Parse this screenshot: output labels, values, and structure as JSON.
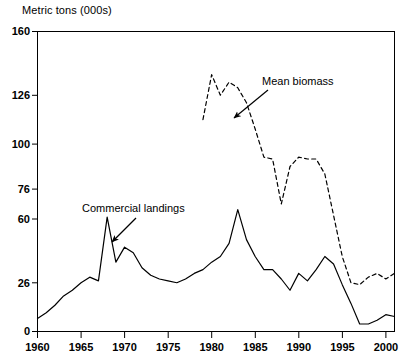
{
  "chart_data": {
    "type": "line",
    "title": "Metric tons (000s)",
    "xlabel": "",
    "ylabel": "Metric tons (000s)",
    "xlim": [
      1960,
      2001
    ],
    "ylim": [
      0,
      160
    ],
    "grid": false,
    "legend_position": "inline-annotations",
    "ytick_labels": [
      "160",
      "126",
      "100",
      "76",
      "60",
      "26",
      "0"
    ],
    "ytick_values": [
      160,
      126,
      100,
      76,
      60,
      26,
      0
    ],
    "xtick_labels": [
      "1960",
      "1965",
      "1970",
      "1975",
      "1980",
      "1985",
      "1990",
      "1995",
      "2000"
    ],
    "xtick_values": [
      1960,
      1965,
      1970,
      1975,
      1980,
      1985,
      1990,
      1995,
      2000
    ],
    "annotations": [
      {
        "name": "mean-biomass-annotation",
        "text": "Mean biomass",
        "text_x": 262,
        "text_y": 75,
        "arrow_from_x": 268,
        "arrow_from_y": 90,
        "arrow_to_x": 234,
        "arrow_to_y": 118
      },
      {
        "name": "commercial-landings-annotation",
        "text": "Commercial landings",
        "text_x": 82,
        "text_y": 202,
        "arrow_from_x": 136,
        "arrow_from_y": 218,
        "arrow_to_x": 112,
        "arrow_to_y": 242
      }
    ],
    "series": [
      {
        "name": "Commercial landings",
        "style": "solid",
        "color": "#000000",
        "x": [
          1960,
          1961,
          1962,
          1963,
          1964,
          1965,
          1966,
          1967,
          1968,
          1969,
          1970,
          1971,
          1972,
          1973,
          1974,
          1975,
          1976,
          1977,
          1978,
          1979,
          1980,
          1981,
          1982,
          1983,
          1984,
          1985,
          1986,
          1987,
          1988,
          1989,
          1990,
          1991,
          1992,
          1993,
          1994,
          1995,
          1996,
          1997,
          1998,
          1999,
          2000,
          2001
        ],
        "values": [
          7,
          10,
          14,
          19,
          22,
          26,
          29,
          27,
          61,
          37,
          45,
          42,
          34,
          30,
          28,
          27,
          26,
          28,
          31,
          33,
          37,
          40,
          47,
          65,
          49,
          40,
          33,
          33,
          28,
          22,
          31,
          27,
          33,
          40,
          36,
          25,
          15,
          4,
          4,
          6,
          9,
          8
        ]
      },
      {
        "name": "Mean biomass",
        "style": "dashed",
        "color": "#000000",
        "x": [
          1979,
          1980,
          1981,
          1982,
          1983,
          1984,
          1985,
          1986,
          1987,
          1988,
          1989,
          1990,
          1991,
          1992,
          1993,
          1994,
          1995,
          1996,
          1997,
          1998,
          1999,
          2000,
          2001
        ],
        "values": [
          113,
          137,
          126,
          133,
          130,
          122,
          108,
          93,
          92,
          68,
          88,
          93,
          92,
          92,
          84,
          62,
          40,
          26,
          25,
          29,
          31,
          28,
          31
        ]
      }
    ]
  }
}
